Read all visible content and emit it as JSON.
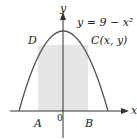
{
  "figure": {
    "equation": "y = 9 − x²",
    "point_c": "C(x, y)",
    "point_d": "D",
    "point_a": "A",
    "point_b": "B",
    "origin": "0",
    "x_axis_label": "x",
    "y_axis_label": "y"
  },
  "colors": {
    "curve": "#555555",
    "axis": "#333333",
    "shade": "#e6e6e6"
  }
}
